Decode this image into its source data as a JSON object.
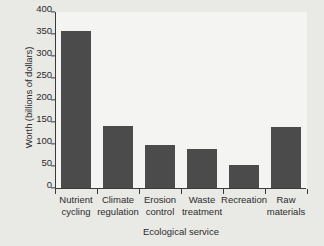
{
  "chart_data": {
    "type": "bar",
    "title": "",
    "xlabel": "Ecological service",
    "ylabel": "Worth (billions of dollars)",
    "categories": [
      "Nutrient cycling",
      "Climate regulation",
      "Erosion control",
      "Waste treatment",
      "Recreation",
      "Raw materials"
    ],
    "category_lines": [
      [
        "Nutrient",
        "cycling"
      ],
      [
        "Climate",
        "regulation"
      ],
      [
        "Erosion",
        "control"
      ],
      [
        "Waste",
        "treatment"
      ],
      [
        "Recreation",
        ""
      ],
      [
        "Raw",
        "materials"
      ]
    ],
    "values": [
      357,
      142,
      97,
      88,
      53,
      138
    ],
    "ylim": [
      0,
      400
    ],
    "yticks": [
      0,
      50,
      100,
      150,
      200,
      250,
      300,
      350,
      400
    ],
    "ytick_labels": [
      "0",
      "50",
      "100",
      "150",
      "200",
      "250",
      "300",
      "350",
      "400"
    ],
    "grid": false,
    "legend": null,
    "legend_position": "none",
    "series": [
      {
        "name": "Worth",
        "values": [
          357,
          142,
          97,
          88,
          53,
          138
        ]
      }
    ]
  },
  "style": {
    "bar_color": "#4b4b4b",
    "axis_color": "#3a3a3a",
    "text_color": "#2b2b2b",
    "plot_background": "#f4f4f2",
    "figure_background": "#e9e9e6"
  }
}
